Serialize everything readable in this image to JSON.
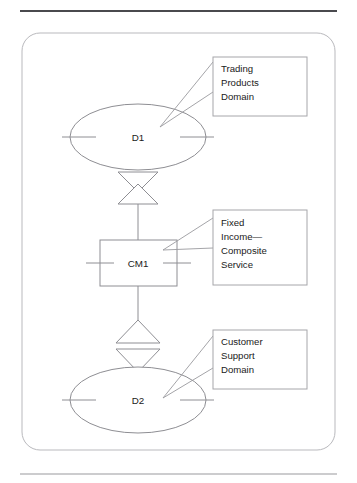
{
  "figure": {
    "frame": {
      "name": "diagram-frame"
    },
    "rules": {
      "top": "horizontal-rule-top",
      "bottom": "horizontal-rule-bottom"
    }
  },
  "nodes": [
    {
      "id": "D1",
      "label": "D1",
      "shape": "ellipse",
      "name": "domain-node-d1"
    },
    {
      "id": "CM1",
      "label": "CM1",
      "shape": "rectangle",
      "name": "composite-service-node-cm1"
    },
    {
      "id": "D2",
      "label": "D2",
      "shape": "ellipse",
      "name": "domain-node-d2"
    }
  ],
  "connectors": [
    {
      "id": "conn-d1-cm1",
      "glyph": "hourglass",
      "from": "D1",
      "to": "CM1",
      "name": "connector-d1-cm1"
    },
    {
      "id": "conn-cm1-d2",
      "glyph": "diamond",
      "from": "CM1",
      "to": "D2",
      "name": "connector-cm1-d2"
    }
  ],
  "callouts": [
    {
      "id": "callout-trading",
      "name": "callout-trading-products-domain",
      "target": "D1",
      "lines": [
        "Trading",
        "Products",
        "Domain"
      ]
    },
    {
      "id": "callout-fixed-income",
      "name": "callout-fixed-income-composite-service",
      "target": "CM1",
      "lines": [
        "Fixed",
        "Income—",
        "Composite",
        "Service"
      ]
    },
    {
      "id": "callout-customer",
      "name": "callout-customer-support-domain",
      "target": "D2",
      "lines": [
        "Customer",
        "Support",
        "Domain"
      ]
    }
  ],
  "colors": {
    "shape_stroke": "#8e8e93",
    "callout_stroke": "#a6a6aa",
    "frame_stroke": "#b9b9bd",
    "rule_top": "#4a4a4e",
    "rule_bottom": "#9a9a9e",
    "text": "#1a1a1a",
    "background": "#ffffff"
  }
}
